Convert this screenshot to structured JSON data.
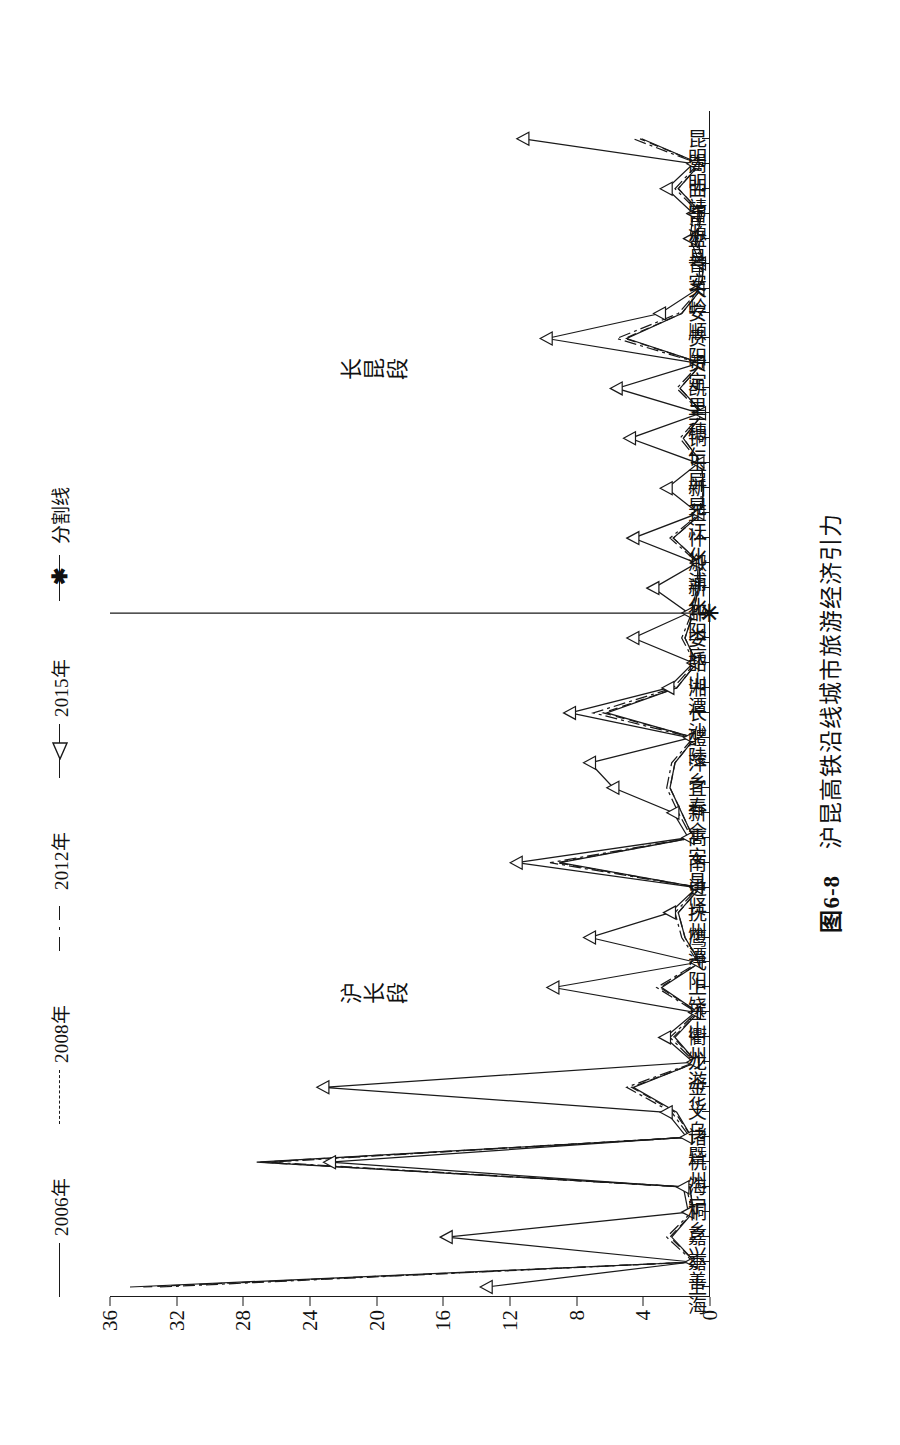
{
  "figure": {
    "caption_number": "图6-8",
    "caption_text": "沪昆高铁沿线城市旅游经济引力"
  },
  "legend": {
    "items": [
      {
        "label": "2006年",
        "style": "solid",
        "marker": "none"
      },
      {
        "label": "2008年",
        "style": "dashed",
        "marker": "none"
      },
      {
        "label": "2012年",
        "style": "dashdot",
        "marker": "none"
      },
      {
        "label": "2015年",
        "style": "solid",
        "marker": "triangle"
      },
      {
        "label": "分割线",
        "style": "solid",
        "marker": "cross"
      }
    ]
  },
  "annotations": {
    "section_left": "沪长段",
    "section_right": "长昆段",
    "divider_marker": "✳"
  },
  "axes": {
    "y_ticks": [
      "0",
      "4",
      "8",
      "12",
      "16",
      "20",
      "24",
      "28",
      "32",
      "36"
    ],
    "y_min": 0,
    "y_max": 36
  },
  "chart_data": {
    "type": "line",
    "title": "沪昆高铁沿线城市旅游经济引力",
    "xlabel": "",
    "ylabel": "",
    "ylim": [
      0,
      36
    ],
    "grid": false,
    "legend_position": "top",
    "divider_index": 27,
    "categories": [
      "上海",
      "嘉善",
      "嘉兴",
      "桐乡",
      "海宁",
      "杭州",
      "诸暨",
      "义乌",
      "金华",
      "龙游",
      "衢州",
      "玉山",
      "上饶",
      "弋阳",
      "鹰潭",
      "抚州",
      "进贤",
      "南昌",
      "高安",
      "新余",
      "宜春",
      "萍乡",
      "醴陵",
      "长沙",
      "湘潭",
      "韶山",
      "娄底",
      "邵阳",
      "新化",
      "溆浦",
      "怀化",
      "芷江",
      "新晃",
      "玉屏",
      "铜仁",
      "三穗",
      "凯里",
      "贵定",
      "贵阳",
      "安顺",
      "关岭",
      "普安",
      "盘县",
      "富源",
      "曲靖",
      "嵩明",
      "昆明"
    ],
    "series": [
      {
        "name": "2006年",
        "style": "solid",
        "values": [
          34.8,
          0.9,
          2.3,
          1.0,
          1.2,
          27.2,
          1.1,
          2.0,
          4.6,
          0.8,
          2.1,
          0.7,
          2.9,
          0.6,
          1.5,
          1.9,
          0.6,
          9.0,
          1.0,
          1.7,
          2.4,
          2.1,
          0.9,
          6.2,
          2.0,
          0.8,
          1.5,
          1.0,
          0.7,
          0.6,
          2.2,
          0.5,
          0.4,
          0.5,
          1.6,
          0.4,
          1.8,
          0.5,
          5.0,
          1.7,
          0.5,
          0.4,
          0.8,
          0.5,
          1.9,
          0.6,
          4.1
        ]
      },
      {
        "name": "2008年",
        "style": "dashed",
        "values": [
          34.0,
          0.9,
          2.4,
          1.0,
          1.2,
          27.0,
          1.1,
          2.1,
          4.7,
          0.8,
          2.2,
          0.7,
          3.0,
          0.6,
          1.5,
          1.9,
          0.6,
          9.2,
          1.0,
          1.7,
          2.4,
          2.1,
          0.9,
          6.4,
          2.0,
          0.8,
          1.5,
          1.0,
          0.7,
          0.6,
          2.2,
          0.5,
          0.4,
          0.5,
          1.6,
          0.4,
          1.8,
          0.5,
          5.1,
          1.7,
          0.5,
          0.4,
          0.8,
          0.5,
          1.9,
          0.6,
          4.2
        ]
      },
      {
        "name": "2012年",
        "style": "dashdot",
        "values": [
          33.0,
          1.0,
          2.6,
          1.1,
          1.4,
          26.4,
          1.2,
          2.3,
          5.0,
          0.9,
          2.4,
          0.8,
          3.2,
          0.7,
          1.7,
          2.1,
          0.7,
          9.6,
          1.1,
          1.9,
          2.6,
          2.3,
          1.0,
          7.0,
          2.2,
          0.9,
          1.7,
          1.1,
          0.8,
          0.7,
          2.4,
          0.6,
          0.5,
          0.6,
          1.8,
          0.5,
          2.0,
          0.6,
          5.6,
          1.9,
          0.6,
          0.5,
          0.9,
          0.6,
          2.1,
          0.7,
          4.6
        ]
      },
      {
        "name": "2015年",
        "style": "solid",
        "marker": "triangle",
        "values": [
          13.4,
          1.1,
          15.8,
          1.3,
          1.6,
          22.8,
          1.4,
          2.6,
          23.2,
          1.0,
          2.7,
          0.9,
          9.4,
          0.8,
          7.2,
          2.4,
          0.8,
          11.6,
          1.3,
          2.2,
          5.8,
          7.2,
          1.2,
          8.4,
          2.5,
          1.0,
          4.6,
          1.3,
          3.4,
          0.8,
          4.6,
          0.7,
          2.6,
          0.7,
          4.8,
          0.6,
          5.6,
          0.7,
          9.8,
          3.0,
          0.7,
          0.6,
          1.2,
          1.0,
          2.6,
          1.0,
          11.2
        ]
      }
    ]
  }
}
